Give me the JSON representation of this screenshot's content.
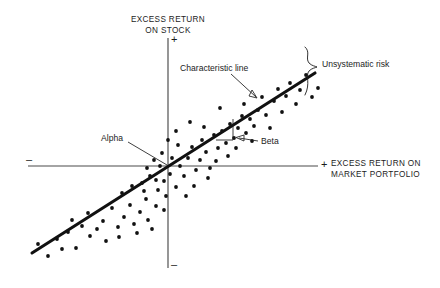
{
  "figure": {
    "title_y_axis": "EXCESS RETURN\nON STOCK",
    "y_axis_line1": "EXCESS RETURN",
    "y_axis_line2": "ON STOCK",
    "x_axis_line1": "EXCESS RETURN ON",
    "x_axis_line2": "MARKET PORTFOLIO",
    "sign_y_positive": "+",
    "sign_y_negative": "–",
    "sign_x_positive": "+",
    "sign_x_negative": "–",
    "label_characteristic_line": "Characteristic line",
    "label_unsystematic_risk": "Unsystematic risk",
    "label_alpha": "Alpha",
    "label_beta": "Beta",
    "colors": {
      "background": "#ffffff",
      "axis": "#4a4a4a",
      "regression_line": "#111111",
      "points": "#111111",
      "text": "#1c1c1c"
    }
  },
  "chart_data": {
    "type": "scatter",
    "title": "",
    "xlabel": "EXCESS RETURN ON MARKET PORTFOLIO",
    "ylabel": "EXCESS RETURN ON STOCK",
    "grid": false,
    "legend": "none",
    "axes": {
      "origin_px": [
        168,
        166
      ],
      "x_axis_extent_px": [
        28,
        318
      ],
      "y_axis_extent_px": [
        38,
        268
      ],
      "x_tick_labels": [
        "–",
        "+"
      ],
      "y_tick_labels": [
        "+",
        "–"
      ]
    },
    "fit_line": {
      "name": "Characteristic line",
      "points_px": [
        [
          32,
          253
        ],
        [
          315,
          73
        ]
      ],
      "slope_label": "Beta",
      "intercept_label": "Alpha"
    },
    "annotations": [
      {
        "text": "Characteristic line",
        "at_px": [
          182,
          68
        ],
        "points_to_px": [
          253,
          96
        ]
      },
      {
        "text": "Unsystematic risk",
        "at_px": [
          320,
          64
        ],
        "points_to_px": [
          310,
          70
        ]
      },
      {
        "text": "Alpha",
        "at_px": [
          106,
          139
        ],
        "points_to_px": [
          168,
          166
        ]
      },
      {
        "text": "Beta",
        "at_px": [
          262,
          142
        ],
        "points_to_px": [
          236,
          138
        ]
      }
    ],
    "points_px": [
      [
        38,
        244
      ],
      [
        48,
        256
      ],
      [
        57,
        239
      ],
      [
        68,
        232
      ],
      [
        62,
        249
      ],
      [
        76,
        248
      ],
      [
        82,
        226
      ],
      [
        72,
        220
      ],
      [
        90,
        236
      ],
      [
        88,
        213
      ],
      [
        97,
        229
      ],
      [
        103,
        221
      ],
      [
        106,
        241
      ],
      [
        112,
        208
      ],
      [
        118,
        227
      ],
      [
        124,
        217
      ],
      [
        119,
        237
      ],
      [
        130,
        205
      ],
      [
        134,
        224
      ],
      [
        140,
        212
      ],
      [
        137,
        233
      ],
      [
        146,
        199
      ],
      [
        148,
        220
      ],
      [
        152,
        229
      ],
      [
        156,
        206
      ],
      [
        142,
        183
      ],
      [
        150,
        176
      ],
      [
        158,
        190
      ],
      [
        160,
        166
      ],
      [
        164,
        181
      ],
      [
        147,
        168
      ],
      [
        154,
        160
      ],
      [
        162,
        153
      ],
      [
        166,
        196
      ],
      [
        170,
        174
      ],
      [
        172,
        158
      ],
      [
        176,
        187
      ],
      [
        180,
        166
      ],
      [
        178,
        145
      ],
      [
        184,
        176
      ],
      [
        188,
        158
      ],
      [
        186,
        196
      ],
      [
        192,
        147
      ],
      [
        196,
        170
      ],
      [
        200,
        160
      ],
      [
        194,
        186
      ],
      [
        202,
        140
      ],
      [
        206,
        152
      ],
      [
        210,
        168
      ],
      [
        214,
        135
      ],
      [
        208,
        178
      ],
      [
        218,
        148
      ],
      [
        222,
        131
      ],
      [
        216,
        161
      ],
      [
        226,
        143
      ],
      [
        230,
        124
      ],
      [
        234,
        138
      ],
      [
        228,
        156
      ],
      [
        238,
        128
      ],
      [
        242,
        116
      ],
      [
        236,
        148
      ],
      [
        246,
        133
      ],
      [
        250,
        119
      ],
      [
        244,
        104
      ],
      [
        254,
        126
      ],
      [
        258,
        110
      ],
      [
        252,
        141
      ],
      [
        262,
        97
      ],
      [
        266,
        115
      ],
      [
        270,
        128
      ],
      [
        274,
        101
      ],
      [
        278,
        89
      ],
      [
        282,
        112
      ],
      [
        286,
        96
      ],
      [
        290,
        83
      ],
      [
        296,
        104
      ],
      [
        300,
        90
      ],
      [
        306,
        75
      ],
      [
        312,
        97
      ],
      [
        318,
        88
      ],
      [
        122,
        193
      ],
      [
        132,
        186
      ],
      [
        144,
        191
      ],
      [
        156,
        180
      ],
      [
        168,
        140
      ],
      [
        176,
        131
      ],
      [
        190,
        122
      ],
      [
        204,
        127
      ],
      [
        220,
        108
      ],
      [
        164,
        210
      ]
    ]
  }
}
